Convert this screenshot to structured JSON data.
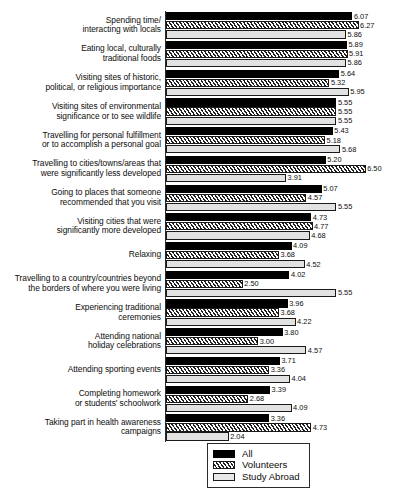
{
  "chart_data": {
    "type": "bar",
    "orientation": "horizontal",
    "title": "",
    "subtitle": "",
    "xlabel": "",
    "ylabel": "",
    "xlim": [
      0,
      7
    ],
    "grid": false,
    "legend_position": "bottom-center",
    "categories": [
      "Spending time/ interacting with locals",
      "Eating local, culturally traditional foods",
      "Visiting sites of historic, political, or religious importance",
      "Visiting sites of environmental significance or to see wildlife",
      "Travelling for personal fulfillment or to accomplish a personal goal",
      "Travelling to cities/towns/areas that were significantly less developed",
      "Going to places that someone recommended that you visit",
      "Visiting cities that were significantly more developed",
      "Relaxing",
      "Travelling to a country/countries beyond the borders of where you were living",
      "Experiencing traditional ceremonies",
      "Attending national holiday celebrations",
      "Attending sporting events",
      "Completing homework or students' schoolwork",
      "Taking part in health awareness campaigns"
    ],
    "category_lines": [
      [
        "Spending time/",
        "interacting with locals"
      ],
      [
        "Eating local, culturally",
        "traditional foods"
      ],
      [
        "Visiting sites of historic,",
        "political, or religious importance"
      ],
      [
        "Visiting sites of environmental",
        "significance or to see wildlife"
      ],
      [
        "Travelling for personal fulfillment",
        "or to accomplish a personal goal"
      ],
      [
        "Travelling to cities/towns/areas that",
        "were significantly less developed"
      ],
      [
        "Going to places that someone",
        "recommended that you visit"
      ],
      [
        "Visiting cities that were",
        "significantly more developed"
      ],
      [
        "Relaxing"
      ],
      [
        "Travelling to a country/countries beyond",
        "the borders of where you were living"
      ],
      [
        "Experiencing traditional",
        "ceremonies"
      ],
      [
        "Attending national",
        "holiday celebrations"
      ],
      [
        "Attending sporting events"
      ],
      [
        "Completing homework",
        "or students' schoolwork"
      ],
      [
        "Taking part in health awareness",
        "campaigns"
      ]
    ],
    "series": [
      {
        "name": "All",
        "fill": "solid-black",
        "color": "#000000",
        "values": [
          6.07,
          5.89,
          5.64,
          5.55,
          5.43,
          5.2,
          5.07,
          4.73,
          4.09,
          4.02,
          3.96,
          3.8,
          3.71,
          3.39,
          3.36
        ]
      },
      {
        "name": "Volunteers",
        "fill": "diagonal-hatch",
        "color": "#ffffff",
        "values": [
          6.27,
          5.91,
          5.32,
          5.55,
          5.18,
          6.5,
          4.57,
          4.77,
          3.68,
          2.5,
          3.68,
          3.0,
          3.36,
          2.68,
          4.73
        ]
      },
      {
        "name": "Study Abroad",
        "fill": "fine-dotted",
        "color": "#e2e2e2",
        "values": [
          5.86,
          5.86,
          5.95,
          5.55,
          5.68,
          3.91,
          5.55,
          4.68,
          4.52,
          5.55,
          4.22,
          4.57,
          4.04,
          4.09,
          2.04
        ]
      }
    ]
  },
  "legend": {
    "items": [
      {
        "label": "All",
        "swatch": "solid-black-swatch"
      },
      {
        "label": "Volunteers",
        "swatch": "diagonal-hatch-swatch"
      },
      {
        "label": "Study Abroad",
        "swatch": "fine-dotted-swatch"
      }
    ]
  }
}
